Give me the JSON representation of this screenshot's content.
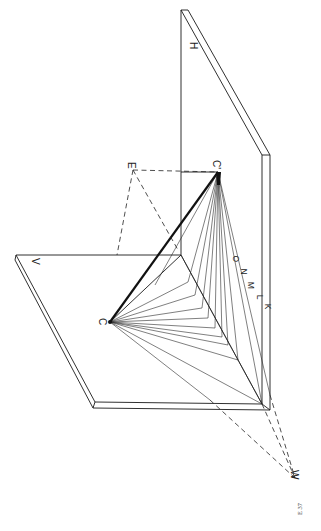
{
  "figure": {
    "caption": "E 37",
    "planes": {
      "horizontal": {
        "label": "H"
      },
      "vertical": {
        "label": "V"
      }
    },
    "points": {
      "C": {
        "label": "C"
      },
      "C_prime": {
        "label": "C'"
      },
      "E": {
        "label": "E"
      },
      "W": {
        "label": "W"
      },
      "K": {
        "label": "K"
      },
      "L": {
        "label": "L"
      },
      "M": {
        "label": "M"
      },
      "N": {
        "label": "N"
      },
      "O": {
        "label": "O"
      }
    },
    "colors": {
      "ink": "#1a1a1a",
      "paper": "#ffffff"
    }
  }
}
